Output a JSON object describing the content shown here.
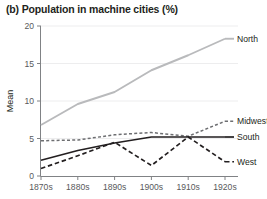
{
  "chart_data": {
    "type": "line",
    "title": "(b) Population in machine cities (%)",
    "xlabel": "",
    "ylabel": "Mean",
    "categories": [
      "1870s",
      "1880s",
      "1890s",
      "1900s",
      "1910s",
      "1920s"
    ],
    "ylim": [
      0,
      20
    ],
    "yticks": [
      0,
      5,
      10,
      15,
      20
    ],
    "ytick_labels": [
      "0",
      "5",
      "10",
      "15",
      "20"
    ],
    "grid": true,
    "legend_position": "right-inline",
    "series": [
      {
        "name": "North",
        "values": [
          6.8,
          9.6,
          11.2,
          14.1,
          16.1,
          18.3
        ],
        "color": "#b9babc",
        "style": "solid",
        "label": "North"
      },
      {
        "name": "Midwest",
        "values": [
          4.7,
          4.8,
          5.5,
          5.8,
          5.3,
          7.3
        ],
        "color": "#6d6e71",
        "style": "dashed",
        "label": "Midwest"
      },
      {
        "name": "South",
        "values": [
          2.1,
          3.4,
          4.4,
          5.2,
          5.2,
          5.2
        ],
        "color": "#231f20",
        "style": "solid",
        "label": "South"
      },
      {
        "name": "West",
        "values": [
          1.0,
          2.7,
          4.5,
          1.4,
          5.2,
          1.9
        ],
        "color": "#231f20",
        "style": "dashed",
        "label": "West"
      }
    ]
  }
}
